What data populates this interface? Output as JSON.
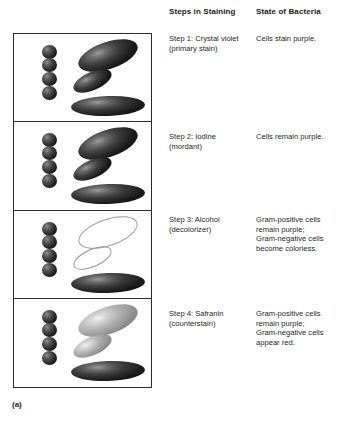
{
  "figure": {
    "caption": "(a)",
    "headers": {
      "steps": "Steps in Staining",
      "state": "State of Bacteria"
    }
  },
  "rows": [
    {
      "step": "Step 1: Crystal violet\n(primary stain)",
      "state": "Cells stain purple.",
      "panel": {
        "cocci_count": 4,
        "cocci_style": "dark",
        "rod_big_style": "dark",
        "rod_small_style": "dark",
        "rod_wide_style": "dark"
      }
    },
    {
      "step": "Step 2: Iodine\n(mordant)",
      "state": "Cells remain purple.",
      "panel": {
        "cocci_count": 4,
        "cocci_style": "dark",
        "rod_big_style": "dark",
        "rod_small_style": "dark",
        "rod_wide_style": "dark"
      }
    },
    {
      "step": "Step 3: Alcohol\n(decolorizer)",
      "state": "Gram-positive cells\nremain purple;\nGram-negative cells\nbecome colorless.",
      "panel": {
        "cocci_count": 4,
        "cocci_style": "dark",
        "rod_big_style": "colorless",
        "rod_small_style": "colorless",
        "rod_wide_style": "dark"
      }
    },
    {
      "step": "Step 4: Safranin\n(counterstain)",
      "state": "Gram-positive cells\nremain purple;\nGram-negative cells\nappear red.",
      "panel": {
        "cocci_count": 4,
        "cocci_style": "dark",
        "rod_big_style": "grey",
        "rod_small_style": "grey",
        "rod_wide_style": "dark"
      }
    }
  ],
  "colors": {
    "border": "#2b2b2b",
    "text": "#231f20",
    "background": "#ffffff",
    "cell_dark": "#1b1b1b",
    "cell_grey": "#b0b0b0",
    "cell_outline": "#9a9a9a"
  }
}
